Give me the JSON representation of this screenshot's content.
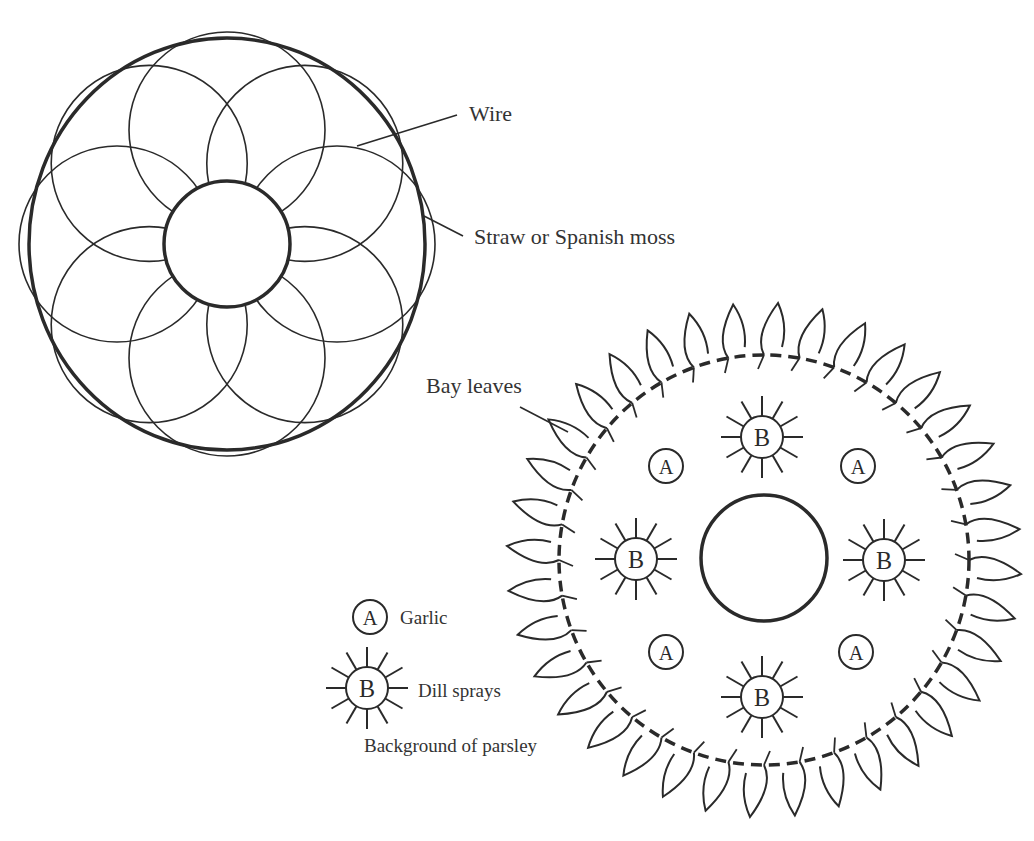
{
  "diagram": {
    "top_wreath": {
      "labels": {
        "wire": "Wire",
        "straw": "Straw or Spanish moss"
      }
    },
    "bottom_wreath": {
      "labels": {
        "bay_leaves": "Bay leaves"
      },
      "markers": {
        "garlic": "A",
        "dill": "B"
      }
    },
    "legend": {
      "items": [
        {
          "symbol": "A",
          "label": "Garlic"
        },
        {
          "symbol": "B",
          "label": "Dill sprays"
        }
      ],
      "note": "Background of parsley"
    },
    "colors": {
      "ink": "#2a2a2a",
      "background": "#ffffff"
    }
  }
}
